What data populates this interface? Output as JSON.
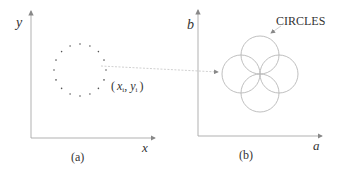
{
  "panel_a": {
    "y_axis_label": "y",
    "x_axis_label": "x",
    "caption": "(a)",
    "point_label_open": "(",
    "point_label_x": "x",
    "point_label_x_sub": "i",
    "point_label_sep": ", ",
    "point_label_y": "y",
    "point_label_y_sub": "i",
    "point_label_close": ")",
    "dotted_circle": {
      "cx": 80,
      "cy": 70,
      "r": 26,
      "dots": 16
    }
  },
  "panel_b": {
    "y_axis_label": "b",
    "x_axis_label": "a",
    "caption": "(b)",
    "annotation": "CIRCLES",
    "circles": [
      {
        "cx": 260,
        "cy": 55,
        "r": 19
      },
      {
        "cx": 241,
        "cy": 74,
        "r": 19
      },
      {
        "cx": 279,
        "cy": 74,
        "r": 19
      },
      {
        "cx": 260,
        "cy": 93,
        "r": 19
      }
    ]
  },
  "colors": {
    "axis": "#9a9a9a",
    "circle": "#b8b8b8",
    "dots": "#555555",
    "text": "#333333"
  }
}
